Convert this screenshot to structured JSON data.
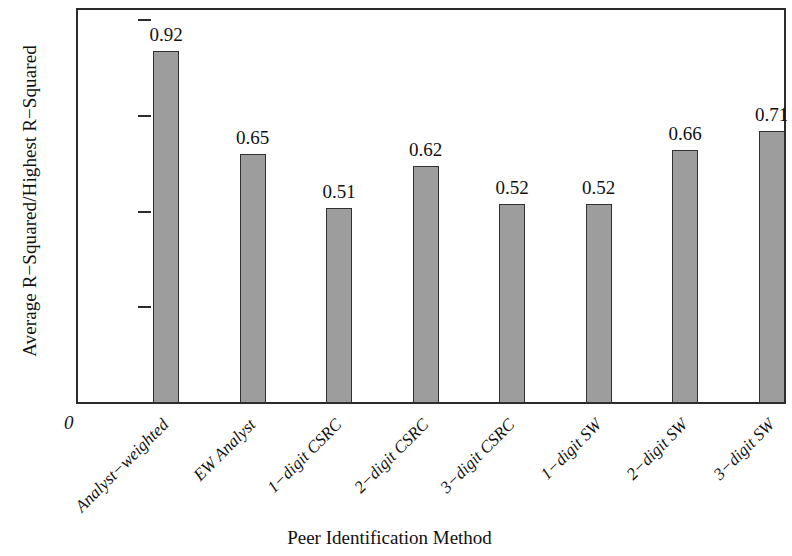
{
  "chart_data": {
    "type": "bar",
    "title": "",
    "xlabel": "Peer Identification Method",
    "ylabel": "Average R−Squared/Highest R−Squared",
    "categories": [
      "Analyst−weighted",
      "EW Analyst",
      "1−digit CSRC",
      "2−digit CSRC",
      "3−digit CSRC",
      "1−digit SW",
      "2−digit SW",
      "3−digit SW"
    ],
    "values": [
      0.92,
      0.65,
      0.51,
      0.62,
      0.52,
      0.52,
      0.66,
      0.71
    ],
    "value_labels": [
      "0.92",
      "0.65",
      "0.51",
      "0.62",
      "0.52",
      "0.52",
      "0.66",
      "0.71"
    ],
    "ylim": [
      0,
      1.0
    ],
    "ytick_values": [
      0,
      0.25,
      0.5,
      0.75,
      1.0
    ],
    "ytick_labels": [
      "0",
      "0.25",
      "0.50",
      "0.75",
      "1.00"
    ],
    "origin_label": "0",
    "grid": false,
    "legend": false,
    "bar_color": "#9d9d9d",
    "bar_edge_color": "#303030",
    "axis_color": "#2b2b2b"
  }
}
